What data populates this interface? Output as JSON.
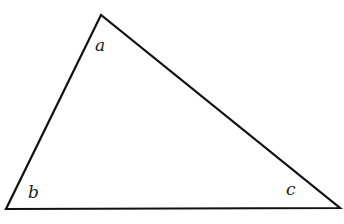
{
  "diagram": {
    "type": "triangle",
    "vertices": {
      "a": {
        "x": 101,
        "y": 15
      },
      "b": {
        "x": 6,
        "y": 209
      },
      "c": {
        "x": 340,
        "y": 208
      }
    },
    "labels": {
      "a": "a",
      "b": "b",
      "c": "c"
    },
    "stroke_color": "#111111",
    "background": "#ffffff"
  }
}
